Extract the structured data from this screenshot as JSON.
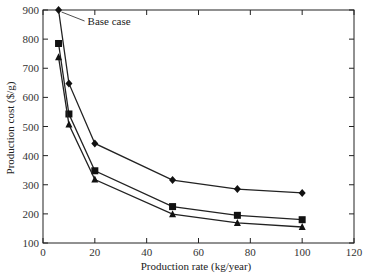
{
  "chart_data": {
    "type": "line",
    "title": "",
    "xlabel": "Production rate (kg/year)",
    "ylabel": "Production cost ($/g)",
    "xlim": [
      0,
      120
    ],
    "ylim": [
      100,
      900
    ],
    "xticks": [
      0,
      20,
      40,
      60,
      80,
      100,
      120
    ],
    "yticks": [
      100,
      200,
      300,
      400,
      500,
      600,
      700,
      800,
      900
    ],
    "grid": false,
    "legend": null,
    "x": [
      6,
      10,
      20,
      50,
      75,
      100
    ],
    "series": [
      {
        "name": "diamond",
        "marker": "diamond",
        "values": [
          900,
          648,
          442,
          316,
          285,
          272
        ]
      },
      {
        "name": "square",
        "marker": "square",
        "values": [
          785,
          543,
          348,
          225,
          195,
          180
        ]
      },
      {
        "name": "triangle",
        "marker": "triangle",
        "values": [
          738,
          507,
          318,
          199,
          169,
          155
        ]
      }
    ],
    "annotations": [
      {
        "text": "Base case",
        "x": 6,
        "y": 900
      }
    ]
  }
}
